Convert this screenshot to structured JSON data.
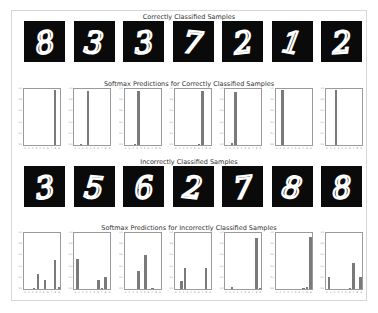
{
  "figure": {
    "correct_title": "Correctly Classified Samples",
    "correct_softmax_title": "Softmax Predictions for Correctly Classified Samples",
    "incorrect_title": "Incorrectly Classified Samples",
    "incorrect_softmax_title": "Softmax Predictions for Incorrectly Classified Samples"
  },
  "axis": {
    "yticks": [
      "1.0",
      "0.8",
      "0.6",
      "0.4",
      "0.2",
      "0.0"
    ],
    "xticks": [
      "0",
      "1",
      "2",
      "3",
      "4",
      "5",
      "6",
      "7",
      "8",
      "9"
    ]
  },
  "colors": {
    "bar": "#7a7a7a",
    "image_bg": "#0a0a0a",
    "stroke": "#ffffff"
  },
  "chart_data": [
    {
      "type": "bar",
      "title": "Softmax Predictions for Correctly Classified Samples",
      "categories": [
        "0",
        "1",
        "2",
        "3",
        "4",
        "5",
        "6",
        "7",
        "8",
        "9"
      ],
      "ylim": [
        0,
        1
      ],
      "series": [
        {
          "name": "sample_1_digit_8",
          "values": [
            0,
            0,
            0,
            0,
            0,
            0,
            0,
            0,
            1.0,
            0
          ]
        },
        {
          "name": "sample_2_digit_3",
          "values": [
            0,
            0.02,
            0,
            0.98,
            0,
            0,
            0,
            0,
            0,
            0
          ]
        },
        {
          "name": "sample_3_digit_3",
          "values": [
            0,
            0,
            0.02,
            0.98,
            0,
            0,
            0,
            0,
            0,
            0
          ]
        },
        {
          "name": "sample_4_digit_7",
          "values": [
            0,
            0,
            0,
            0,
            0,
            0,
            0.01,
            0.99,
            0,
            0
          ]
        },
        {
          "name": "sample_5_digit_2",
          "values": [
            0,
            0.04,
            0.96,
            0,
            0,
            0,
            0,
            0,
            0,
            0
          ]
        },
        {
          "name": "sample_6_digit_1",
          "values": [
            0,
            1.0,
            0,
            0,
            0,
            0,
            0,
            0,
            0,
            0
          ]
        },
        {
          "name": "sample_7_digit_2",
          "values": [
            0,
            0,
            1.0,
            0,
            0,
            0,
            0,
            0,
            0,
            0
          ]
        }
      ]
    },
    {
      "type": "bar",
      "title": "Softmax Predictions for Incorrectly Classified Samples",
      "categories": [
        "0",
        "1",
        "2",
        "3",
        "4",
        "5",
        "6",
        "7",
        "8",
        "9"
      ],
      "ylim": [
        0,
        1
      ],
      "series": [
        {
          "name": "sample_1_digit_3",
          "values": [
            0,
            0,
            0.01,
            0.27,
            0,
            0.16,
            0,
            0,
            0.52,
            0.03
          ]
        },
        {
          "name": "sample_2_digit_5",
          "values": [
            0.55,
            0,
            0,
            0,
            0,
            0,
            0.17,
            0.02,
            0.22,
            0
          ]
        },
        {
          "name": "sample_3_digit_6",
          "values": [
            0,
            0,
            0,
            0.33,
            0,
            0.62,
            0,
            0.02,
            0,
            0
          ]
        },
        {
          "name": "sample_4_digit_2",
          "values": [
            0,
            0.14,
            0.39,
            0,
            0,
            0,
            0,
            0,
            0.39,
            0
          ]
        },
        {
          "name": "sample_5_digit_7",
          "values": [
            0,
            0.04,
            0,
            0,
            0,
            0,
            0,
            0,
            0.93,
            0.01
          ]
        },
        {
          "name": "sample_6_digit_8",
          "values": [
            0,
            0,
            0,
            0,
            0,
            0,
            0,
            0.02,
            0.03,
            0.94
          ]
        },
        {
          "name": "sample_7_digit_8",
          "values": [
            0.22,
            0,
            0,
            0,
            0,
            0,
            0.01,
            0.48,
            0,
            0.22
          ]
        }
      ]
    }
  ],
  "correct_digits": [
    "8",
    "3",
    "3",
    "7",
    "2",
    "1",
    "2"
  ],
  "incorrect_digits": [
    "3",
    "5",
    "6",
    "2",
    "7",
    "8",
    "8"
  ]
}
